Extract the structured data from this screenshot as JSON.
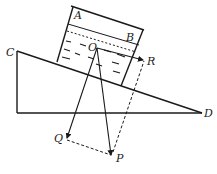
{
  "diagram": {
    "type": "physics-force-diagram",
    "labels": {
      "A": "A",
      "B": "B",
      "C": "C",
      "D": "D",
      "O": "O",
      "P": "P",
      "Q": "Q",
      "R": "R"
    },
    "colors": {
      "stroke": "#1a1a1a",
      "background": "#ffffff"
    },
    "vectors": [
      {
        "from": "O",
        "to": "Q",
        "style": "solid-arrow"
      },
      {
        "from": "O",
        "to": "P",
        "style": "solid-arrow"
      },
      {
        "from": "O",
        "to": "R",
        "style": "solid-arrow"
      }
    ],
    "construction_lines": [
      {
        "from": "Q",
        "to": "P",
        "style": "dashed"
      },
      {
        "from": "P",
        "to": "R",
        "style": "dashed"
      }
    ]
  }
}
